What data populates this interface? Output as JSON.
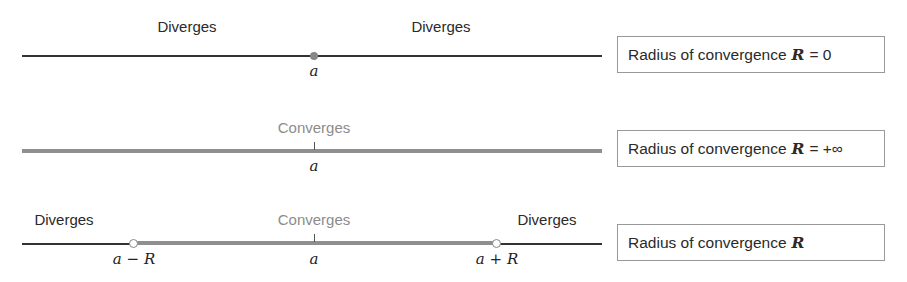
{
  "rows": [
    {
      "labels": {
        "left": "Diverges",
        "right": "Diverges"
      },
      "point_label": "a",
      "box": {
        "text": "Radius of convergence",
        "symbol": "R",
        "value": "= 0"
      }
    },
    {
      "labels": {
        "center": "Converges"
      },
      "point_label": "a",
      "box": {
        "text": "Radius of convergence",
        "symbol": "R",
        "value": "= +∞"
      }
    },
    {
      "labels": {
        "left": "Diverges",
        "center": "Converges",
        "right": "Diverges"
      },
      "point_labels": {
        "left": "a − R",
        "center": "a",
        "right": "a + R"
      },
      "box": {
        "text": "Radius of convergence",
        "symbol": "R",
        "value": ""
      }
    }
  ],
  "colors": {
    "line": "#333333",
    "converge": "#8f8f8f",
    "text_gray": "#8c8c8c"
  }
}
